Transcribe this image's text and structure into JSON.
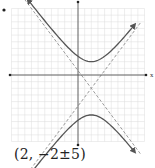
{
  "graph": {
    "type": "hyperbola",
    "orientation": "vertical",
    "center": [
      2,
      -2
    ],
    "a": 4,
    "b": 3,
    "c": 5,
    "equation": "(y+2)^2/16 - (x-2)^2/9 = 1",
    "asymptote_slopes": [
      1.3333,
      -1.3333
    ],
    "x_range": [
      -10,
      10
    ],
    "y_range": [
      -10,
      10
    ],
    "grid": true,
    "axis_label_x": "x",
    "axis_label_y": "y",
    "colors": {
      "grid": "#dcdcdc",
      "axis": "#555555",
      "curve": "#555555",
      "asymptote": "#9a9a9a"
    }
  },
  "marker_left": "•",
  "caption": "(2, −2±5)"
}
